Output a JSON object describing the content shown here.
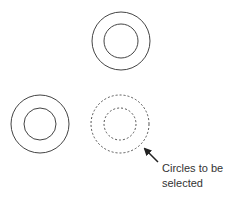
{
  "diagram": {
    "type": "cad-selection-illustration",
    "circle_groups": [
      {
        "id": "top",
        "cx": 121,
        "cy": 41,
        "outer_r": 29,
        "inner_r": 17,
        "style": "solid"
      },
      {
        "id": "bottom-left",
        "cx": 40,
        "cy": 124,
        "outer_r": 29,
        "inner_r": 16,
        "style": "solid"
      },
      {
        "id": "bottom-right",
        "cx": 120,
        "cy": 124,
        "outer_r": 29,
        "inner_r": 16,
        "style": "dashed"
      }
    ],
    "annotation": {
      "line1": "Circles to be",
      "line2": "selected",
      "arrow": {
        "from": [
          158,
          162
        ],
        "to": [
          144,
          148
        ]
      }
    },
    "colors": {
      "stroke": "#444444",
      "dashed_stroke": "#555555",
      "text": "#333333",
      "background": "#ffffff"
    }
  }
}
